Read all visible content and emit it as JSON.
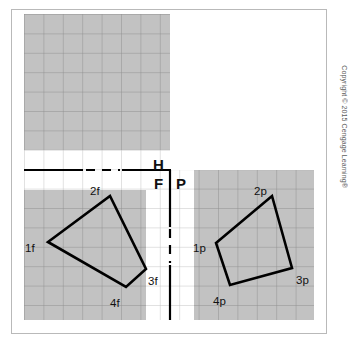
{
  "figure": {
    "background_color": "#ffffff",
    "frame_color": "#b9b9b9",
    "grid_fill_color": "#c2c2c2",
    "grid_line_color": "#8d8d8d",
    "line_color": "#000000",
    "cell_size_px": 19.4
  },
  "plane_labels": [
    {
      "name": "horizontal-plane-label",
      "text": "H",
      "x": 153,
      "y": 157
    },
    {
      "name": "front-plane-label",
      "text": "F",
      "x": 154,
      "y": 176
    },
    {
      "name": "profile-plane-label",
      "text": "P",
      "x": 176,
      "y": 176
    }
  ],
  "front_view": {
    "name": "front-view-polygon",
    "vertices": [
      {
        "label": "1f",
        "x": 48,
        "y": 242,
        "label_x": 25,
        "label_y": 243
      },
      {
        "label": "2f",
        "x": 110,
        "y": 196,
        "label_x": 90,
        "label_y": 186
      },
      {
        "label": "3f",
        "x": 146,
        "y": 269,
        "label_x": 148,
        "label_y": 276
      },
      {
        "label": "4f",
        "x": 126,
        "y": 287,
        "label_x": 110,
        "label_y": 298
      }
    ]
  },
  "profile_view": {
    "name": "profile-view-polygon",
    "vertices": [
      {
        "label": "1p",
        "x": 216,
        "y": 243,
        "label_x": 193,
        "label_y": 243
      },
      {
        "label": "2p",
        "x": 272,
        "y": 196,
        "label_x": 254,
        "label_y": 186
      },
      {
        "label": "3p",
        "x": 292,
        "y": 268,
        "label_x": 296,
        "label_y": 275
      },
      {
        "label": "4p",
        "x": 230,
        "y": 285,
        "label_x": 213,
        "label_y": 296
      }
    ]
  },
  "fold_lines": {
    "horizontal_fold": {
      "name": "h-f-fold-line",
      "x1": 24,
      "y1": 170,
      "x2": 170,
      "y2": 170
    },
    "vertical_fold": {
      "name": "f-p-fold-line",
      "x1": 170,
      "y1": 170,
      "x2": 170,
      "y2": 320
    }
  },
  "copyright": {
    "text": "Copyright © 2015 Cengage Learning®"
  }
}
